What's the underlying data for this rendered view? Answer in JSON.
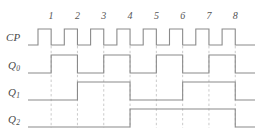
{
  "diagram": {
    "colors": {
      "waveform": "#8a8a8a",
      "dashed_guide": "#b9b9b9",
      "text": "#4a4a4a",
      "background": "#ffffff"
    },
    "signals": [
      {
        "name": "CP",
        "label": "CP",
        "subscript": "",
        "row_y": 38,
        "description": "clock pulse train, 8 pulses"
      },
      {
        "name": "Q0",
        "label": "Q",
        "subscript": "0",
        "row_y": 66,
        "description": "toggles every clock falling edge (divide by 2)"
      },
      {
        "name": "Q1",
        "label": "Q",
        "subscript": "1",
        "row_y": 93,
        "description": "toggles every 2 clock falling edges (divide by 4)"
      },
      {
        "name": "Q2",
        "label": "Q",
        "subscript": "2",
        "row_y": 120,
        "description": "toggles every 4 clock falling edges (divide by 8)"
      }
    ],
    "cycle_numbers": [
      "1",
      "2",
      "3",
      "4",
      "5",
      "6",
      "7",
      "8"
    ]
  },
  "chart_data": {
    "type": "line",
    "xlabel": "clock cycle",
    "ylabel": "logic level",
    "grid": false,
    "legend_position": "left-labels",
    "x": [
      1,
      2,
      3,
      4,
      5,
      6,
      7,
      8
    ],
    "tick_labels": [
      "1",
      "2",
      "3",
      "4",
      "5",
      "6",
      "7",
      "8"
    ],
    "ylim": [
      0,
      1
    ],
    "annotations": [
      "dashed vertical guides mark each CP falling edge"
    ],
    "series": [
      {
        "name": "CP",
        "values": [
          1,
          1,
          1,
          1,
          1,
          1,
          1,
          1
        ],
        "waveform": "pulse train: high during first half of each cycle, low during second half"
      },
      {
        "name": "Q0",
        "values": [
          1,
          0,
          1,
          0,
          1,
          0,
          1,
          0
        ],
        "waveform": "divide-by-2 of CP, changes on CP falling edge"
      },
      {
        "name": "Q1",
        "values": [
          0,
          1,
          1,
          0,
          0,
          1,
          1,
          0
        ],
        "waveform": "divide-by-4 of CP, changes on CP falling edge"
      },
      {
        "name": "Q2",
        "values": [
          0,
          0,
          0,
          1,
          1,
          1,
          1,
          0
        ],
        "waveform": "divide-by-8 of CP, changes on CP falling edge"
      }
    ]
  }
}
